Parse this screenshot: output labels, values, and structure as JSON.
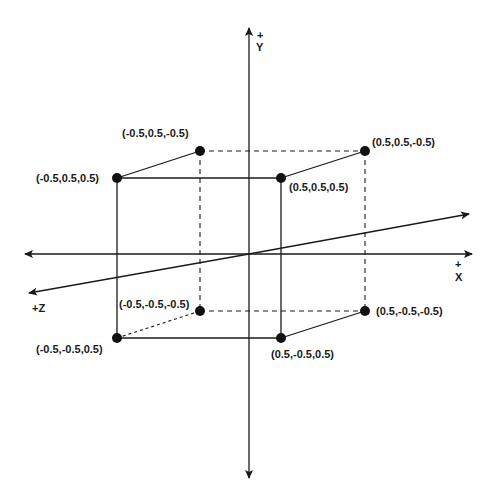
{
  "diagram": {
    "axes": {
      "x": {
        "sign": "+",
        "label": "X"
      },
      "y": {
        "sign": "+",
        "label": "Y"
      },
      "z": {
        "label": "+Z"
      }
    },
    "vertices": [
      {
        "id": "v1",
        "label": "(-0.5,0.5,-0.5)",
        "x": 200,
        "y": 151,
        "lx": 122,
        "ly": 137,
        "anchor": "start"
      },
      {
        "id": "v2",
        "label": "(0.5,0.5,-0.5)",
        "x": 365,
        "y": 151,
        "lx": 372,
        "ly": 146,
        "anchor": "start"
      },
      {
        "id": "v3",
        "label": "(-0.5,0.5,0.5)",
        "x": 117,
        "y": 178,
        "lx": 36,
        "ly": 182,
        "anchor": "start"
      },
      {
        "id": "v4",
        "label": "(0.5,0.5,0.5)",
        "x": 281,
        "y": 178,
        "lx": 289,
        "ly": 191,
        "anchor": "start"
      },
      {
        "id": "v5",
        "label": "(-0.5,-0.5,-0.5)",
        "x": 200,
        "y": 311,
        "lx": 119,
        "ly": 308,
        "anchor": "start"
      },
      {
        "id": "v6",
        "label": "(0.5,-0.5,-0.5)",
        "x": 365,
        "y": 311,
        "lx": 376,
        "ly": 315,
        "anchor": "start"
      },
      {
        "id": "v7",
        "label": "(-0.5,-0.5,0.5)",
        "x": 117,
        "y": 338,
        "lx": 36,
        "ly": 353,
        "anchor": "start"
      },
      {
        "id": "v8",
        "label": "(0.5,-0.5,0.5)",
        "x": 281,
        "y": 338,
        "lx": 271,
        "ly": 358,
        "anchor": "start"
      }
    ],
    "colors": {
      "stroke": "#1a1a1a",
      "background": "#ffffff"
    }
  }
}
